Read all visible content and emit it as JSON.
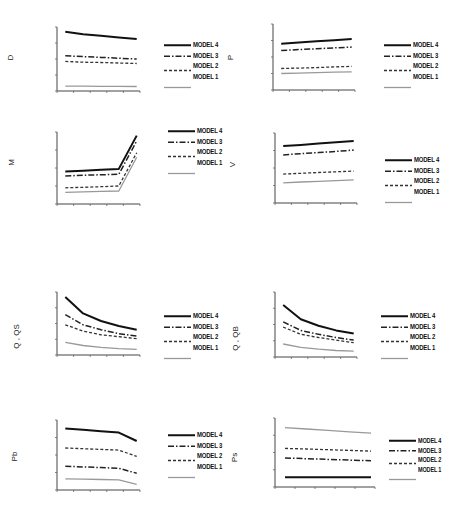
{
  "chart_data": [
    {
      "id": "D",
      "type": "line",
      "ylabel": "D",
      "title": "",
      "xlabel": "",
      "x": [
        1,
        2,
        3,
        4,
        5
      ],
      "ylim": [
        0,
        4
      ],
      "grid": false,
      "legend_position": "right",
      "series": [
        {
          "name": "MODEL 4",
          "values": [
            3.7,
            3.55,
            3.45,
            3.35,
            3.25
          ]
        },
        {
          "name": "MODEL 3",
          "values": [
            2.2,
            2.15,
            2.1,
            2.05,
            2.0
          ]
        },
        {
          "name": "MODEL 2",
          "values": [
            1.85,
            1.8,
            1.78,
            1.75,
            1.72
          ]
        },
        {
          "name": "MODEL 1",
          "values": [
            0.3,
            0.3,
            0.29,
            0.29,
            0.28
          ]
        }
      ]
    },
    {
      "id": "P",
      "type": "line",
      "ylabel": "P",
      "title": "",
      "xlabel": "",
      "x": [
        1,
        2,
        3,
        4,
        5
      ],
      "ylim": [
        0,
        4
      ],
      "grid": false,
      "legend_position": "right",
      "series": [
        {
          "name": "MODEL 4",
          "values": [
            2.8,
            2.88,
            2.95,
            3.02,
            3.1
          ]
        },
        {
          "name": "MODEL 3",
          "values": [
            2.4,
            2.45,
            2.5,
            2.55,
            2.6
          ]
        },
        {
          "name": "MODEL 2",
          "values": [
            1.3,
            1.33,
            1.36,
            1.4,
            1.43
          ]
        },
        {
          "name": "MODEL 1",
          "values": [
            1.0,
            1.02,
            1.05,
            1.08,
            1.1
          ]
        }
      ]
    },
    {
      "id": "M",
      "type": "line",
      "ylabel": "M",
      "title": "",
      "xlabel": "",
      "x": [
        1,
        2,
        3,
        4,
        5
      ],
      "ylim": [
        0,
        4
      ],
      "grid": false,
      "legend_position": "right",
      "series": [
        {
          "name": "MODEL 4",
          "values": [
            1.8,
            1.85,
            1.9,
            1.95,
            3.8
          ]
        },
        {
          "name": "MODEL 3",
          "values": [
            1.55,
            1.6,
            1.62,
            1.65,
            3.5
          ]
        },
        {
          "name": "MODEL 2",
          "values": [
            0.9,
            0.93,
            0.96,
            1.0,
            2.85
          ]
        },
        {
          "name": "MODEL 1",
          "values": [
            0.65,
            0.68,
            0.7,
            0.72,
            2.6
          ]
        }
      ]
    },
    {
      "id": "V",
      "type": "line",
      "ylabel": "V",
      "title": "",
      "xlabel": "",
      "x": [
        1,
        2,
        3,
        4,
        5
      ],
      "ylim": [
        0,
        4
      ],
      "grid": false,
      "legend_position": "right",
      "series": [
        {
          "name": "MODEL 4",
          "values": [
            3.25,
            3.32,
            3.4,
            3.47,
            3.55
          ]
        },
        {
          "name": "MODEL 3",
          "values": [
            2.75,
            2.82,
            2.88,
            2.95,
            3.02
          ]
        },
        {
          "name": "MODEL 2",
          "values": [
            1.65,
            1.7,
            1.74,
            1.78,
            1.82
          ]
        },
        {
          "name": "MODEL 1",
          "values": [
            1.15,
            1.2,
            1.24,
            1.28,
            1.32
          ]
        }
      ]
    },
    {
      "id": "Q_QS",
      "type": "line",
      "ylabel": "Q , QS",
      "title": "",
      "xlabel": "",
      "x": [
        1,
        2,
        3,
        4,
        5
      ],
      "ylim": [
        0,
        5
      ],
      "grid": false,
      "legend_position": "right",
      "series": [
        {
          "name": "MODEL 4",
          "values": [
            4.6,
            3.3,
            2.7,
            2.3,
            2.0
          ]
        },
        {
          "name": "MODEL 3",
          "values": [
            3.2,
            2.4,
            2.0,
            1.7,
            1.5
          ]
        },
        {
          "name": "MODEL 2",
          "values": [
            2.4,
            1.9,
            1.6,
            1.45,
            1.3
          ]
        },
        {
          "name": "MODEL 1",
          "values": [
            1.0,
            0.75,
            0.6,
            0.5,
            0.45
          ]
        }
      ]
    },
    {
      "id": "Q_QB",
      "type": "line",
      "ylabel": "Q , QB",
      "title": "",
      "xlabel": "",
      "x": [
        1,
        2,
        3,
        4,
        5
      ],
      "ylim": [
        0,
        5
      ],
      "grid": false,
      "legend_position": "right",
      "series": [
        {
          "name": "MODEL 4",
          "values": [
            4.0,
            2.9,
            2.4,
            2.05,
            1.8
          ]
        },
        {
          "name": "MODEL 3",
          "values": [
            2.7,
            2.05,
            1.75,
            1.5,
            1.3
          ]
        },
        {
          "name": "MODEL 2",
          "values": [
            2.3,
            1.75,
            1.5,
            1.3,
            1.1
          ]
        },
        {
          "name": "MODEL 1",
          "values": [
            1.0,
            0.75,
            0.6,
            0.5,
            0.45
          ]
        }
      ]
    },
    {
      "id": "Pb",
      "type": "line",
      "ylabel": "Pb",
      "title": "",
      "xlabel": "",
      "x": [
        1,
        2,
        3,
        4,
        5
      ],
      "ylim": [
        0,
        5
      ],
      "grid": false,
      "legend_position": "right",
      "series": [
        {
          "name": "MODEL 4",
          "values": [
            4.4,
            4.3,
            4.2,
            4.1,
            3.5
          ]
        },
        {
          "name": "MODEL 3",
          "values": [
            1.7,
            1.65,
            1.6,
            1.55,
            1.2
          ]
        },
        {
          "name": "MODEL 2",
          "values": [
            3.0,
            2.95,
            2.9,
            2.85,
            2.4
          ]
        },
        {
          "name": "MODEL 1",
          "values": [
            0.8,
            0.78,
            0.75,
            0.72,
            0.4
          ]
        }
      ]
    },
    {
      "id": "Ps",
      "type": "line",
      "ylabel": "Ps",
      "title": "",
      "xlabel": "",
      "x": [
        1,
        2,
        3,
        4,
        5
      ],
      "ylim": [
        0,
        5
      ],
      "grid": false,
      "legend_position": "right",
      "series": [
        {
          "name": "MODEL 4",
          "values": [
            0.7,
            0.7,
            0.7,
            0.7,
            0.7
          ]
        },
        {
          "name": "MODEL 3",
          "values": [
            2.1,
            2.05,
            2.0,
            1.95,
            1.9
          ]
        },
        {
          "name": "MODEL 2",
          "values": [
            2.8,
            2.75,
            2.7,
            2.65,
            2.6
          ]
        },
        {
          "name": "MODEL 1",
          "values": [
            4.3,
            4.2,
            4.1,
            4.0,
            3.9
          ]
        }
      ]
    }
  ],
  "series_styles": {
    "MODEL 4": {
      "color": "#111111",
      "width": 2,
      "dash": ""
    },
    "MODEL 3": {
      "color": "#222222",
      "width": 1.5,
      "dash": "6,2,1.5,2"
    },
    "MODEL 2": {
      "color": "#333333",
      "width": 1.3,
      "dash": "3,2"
    },
    "MODEL 1": {
      "color": "#999999",
      "width": 1.3,
      "dash": ""
    }
  },
  "legend": {
    "labels": [
      "MODEL 4",
      "MODEL 3",
      "MODEL 2",
      "MODEL 1"
    ]
  }
}
